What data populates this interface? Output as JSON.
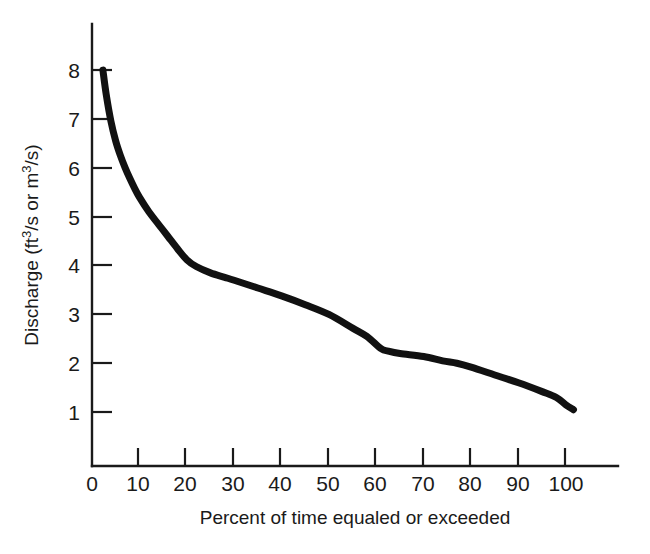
{
  "figure": {
    "background_color": "#ffffff",
    "ink_color": "#1a1a1a",
    "width": 650,
    "height": 554
  },
  "axes": {
    "x": {
      "label_prefix": "Percent of time equaled or exceeded",
      "tick_labels": [
        "0",
        "10",
        "20",
        "30",
        "40",
        "50",
        "60",
        "70",
        "80",
        "90",
        "100"
      ],
      "tick_values": [
        0,
        10,
        20,
        30,
        40,
        50,
        60,
        70,
        80,
        90,
        100
      ],
      "range": [
        0,
        111
      ]
    },
    "y": {
      "label_part1": "Discharge (ft",
      "label_sup1": "3",
      "label_part2": "/s or m",
      "label_sup2": "3",
      "label_part3": "/s)",
      "label_plain": "Discharge (ft3/s or m3/s)",
      "tick_labels": [
        "1",
        "2",
        "3",
        "4",
        "5",
        "6",
        "7",
        "8"
      ],
      "tick_values": [
        1,
        2,
        3,
        4,
        5,
        6,
        7,
        8
      ],
      "range": [
        0,
        8.95
      ]
    }
  },
  "chart_data": {
    "type": "line",
    "title": "",
    "subtitle": "",
    "xlabel": "Percent of time equaled or exceeded",
    "ylabel": "Discharge (ft3/s or m3/s)",
    "xlim": [
      0,
      111
    ],
    "ylim": [
      0,
      8.95
    ],
    "xticks": [
      0,
      10,
      20,
      30,
      40,
      50,
      60,
      70,
      80,
      90,
      100
    ],
    "yticks": [
      1,
      2,
      3,
      4,
      5,
      6,
      7,
      8
    ],
    "grid": false,
    "legend": false,
    "legend_position": "none",
    "series": [
      {
        "name": "Flow duration curve",
        "color": "#111111",
        "line_width": 7,
        "x": [
          2.3,
          3.0,
          4.0,
          5.0,
          6.0,
          7.0,
          8.0,
          9.0,
          10.0,
          12.0,
          14.0,
          16.0,
          18.0,
          20.0,
          22.0,
          25.0,
          28.0,
          30.0,
          35.0,
          40.0,
          45.0,
          50.0,
          55.0,
          58.0,
          61.0,
          62.5,
          65.0,
          70.0,
          74.0,
          77.0,
          80.0,
          85.0,
          90.0,
          95.0,
          98.0,
          100.0,
          101.6
        ],
        "y": [
          8.0,
          7.5,
          6.95,
          6.55,
          6.25,
          6.0,
          5.78,
          5.58,
          5.4,
          5.1,
          4.85,
          4.6,
          4.35,
          4.12,
          3.98,
          3.85,
          3.76,
          3.7,
          3.54,
          3.38,
          3.2,
          3.0,
          2.72,
          2.55,
          2.3,
          2.25,
          2.2,
          2.14,
          2.05,
          2.0,
          1.92,
          1.76,
          1.6,
          1.42,
          1.3,
          1.15,
          1.05
        ]
      }
    ],
    "annotations": []
  }
}
